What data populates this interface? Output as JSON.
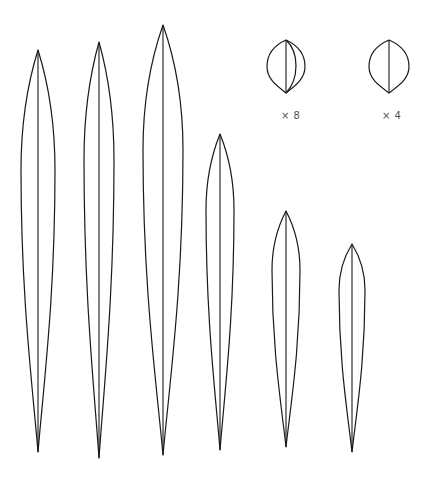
{
  "figure": {
    "leaves": [
      {
        "id": "leaf-1",
        "cx": 38,
        "top": 50,
        "bottom": 452,
        "halfwidth": 17,
        "widest_y": 170
      },
      {
        "id": "leaf-2",
        "cx": 99,
        "top": 42,
        "bottom": 458,
        "halfwidth": 15,
        "widest_y": 160
      },
      {
        "id": "leaf-3",
        "cx": 163,
        "top": 25,
        "bottom": 455,
        "halfwidth": 20,
        "widest_y": 150
      },
      {
        "id": "leaf-4",
        "cx": 220,
        "top": 134,
        "bottom": 450,
        "halfwidth": 14,
        "widest_y": 210
      },
      {
        "id": "leaf-5",
        "cx": 286,
        "top": 211,
        "bottom": 447,
        "halfwidth": 14,
        "widest_y": 270
      },
      {
        "id": "leaf-6",
        "cx": 352,
        "top": 244,
        "bottom": 452,
        "halfwidth": 13,
        "widest_y": 290
      }
    ],
    "details": [
      {
        "id": "detail-x8",
        "cx": 286,
        "top": 40,
        "bottom": 93,
        "halfwidth": 19,
        "label": "× 8",
        "extra_inner_curve": true
      },
      {
        "id": "detail-x4",
        "cx": 389,
        "top": 40,
        "bottom": 93,
        "halfwidth": 20,
        "label": "× 4",
        "extra_inner_curve": false
      }
    ],
    "stroke_color": "#1a1a1a",
    "label_color": "#555555"
  }
}
